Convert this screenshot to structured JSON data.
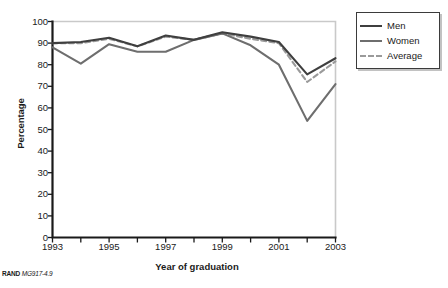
{
  "chart_data": {
    "type": "line",
    "title": "",
    "xlabel": "Year of graduation",
    "ylabel": "Percentage",
    "x": [
      1993,
      1994,
      1995,
      1996,
      1997,
      1998,
      1999,
      2000,
      2001,
      2002,
      2003
    ],
    "xlim": [
      1993,
      2003
    ],
    "ylim": [
      0,
      100
    ],
    "xticks": [
      1993,
      1994,
      1995,
      1996,
      1997,
      1998,
      1999,
      2000,
      2001,
      2002,
      2003
    ],
    "xtick_labels": [
      "1993",
      "",
      "1995",
      "",
      "1997",
      "",
      "1999",
      "",
      "2001",
      "",
      "2003"
    ],
    "yticks": [
      0,
      10,
      20,
      30,
      40,
      50,
      60,
      70,
      80,
      90,
      100
    ],
    "ytick_labels": [
      "0",
      "10",
      "20",
      "30",
      "40",
      "50",
      "60",
      "70",
      "80",
      "90",
      "100"
    ],
    "grid": false,
    "legend_position": "upper right outside",
    "series": [
      {
        "name": "Men",
        "color": "#3f3f3f",
        "style": "solid",
        "values": [
          90,
          90.5,
          92.5,
          88.5,
          93.5,
          91.5,
          95,
          93,
          90.5,
          75.5,
          83
        ]
      },
      {
        "name": "Women",
        "color": "#6e6e6e",
        "style": "solid",
        "values": [
          88,
          80.5,
          89.5,
          86,
          86,
          91.5,
          94.5,
          89,
          80,
          54,
          71
        ]
      },
      {
        "name": "Average",
        "color": "#9a9a9a",
        "style": "dashed",
        "values": [
          90,
          90,
          92,
          88.5,
          93,
          91.5,
          94.5,
          92,
          90,
          72,
          81.5
        ]
      }
    ]
  },
  "legend": {
    "items": [
      {
        "label": "Men"
      },
      {
        "label": "Women"
      },
      {
        "label": "Average"
      }
    ]
  },
  "footer": {
    "organization": "RAND",
    "figure_code": "MG917-4.9"
  },
  "colors": {
    "men": "#3f3f3f",
    "women": "#6e6e6e",
    "average": "#9a9a9a",
    "axis": "#1a1a1a",
    "frame": "#c9c9c9",
    "background": "#ffffff"
  }
}
